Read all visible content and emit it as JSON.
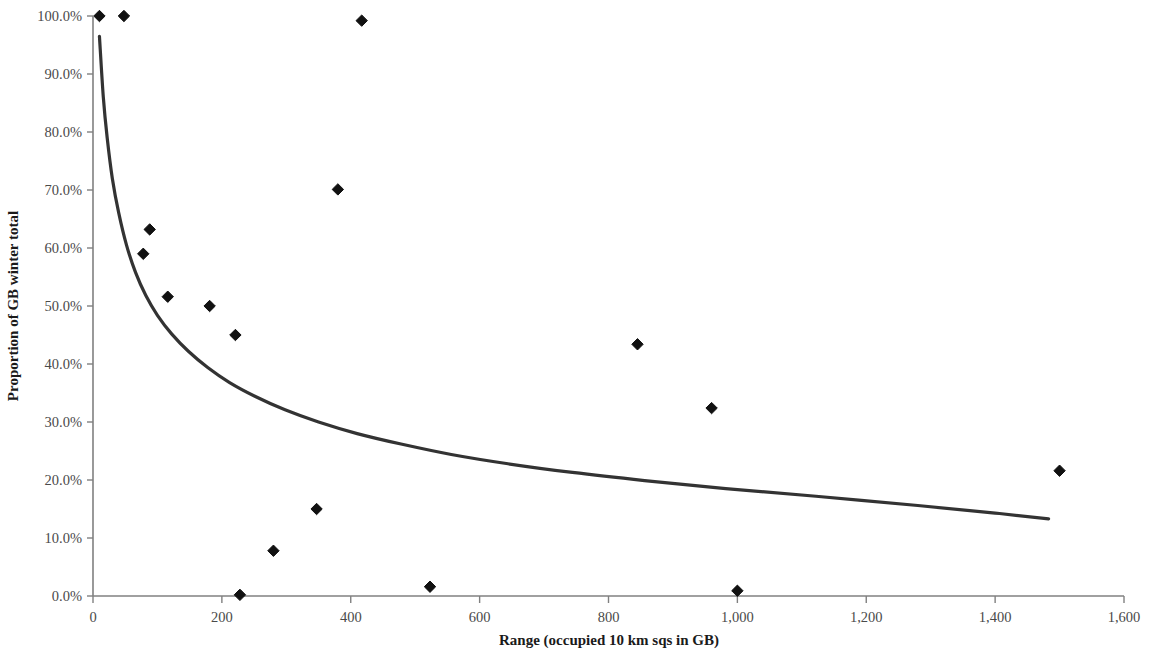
{
  "chart_data": {
    "type": "scatter",
    "title": "",
    "xlabel": "Range (occupied 10 km sqs in GB)",
    "ylabel": "Proportion of GB winter total",
    "xlim": [
      0,
      1600
    ],
    "ylim": [
      0,
      100
    ],
    "grid": false,
    "legend": null,
    "x_ticks": [
      0,
      200,
      400,
      600,
      800,
      1000,
      1200,
      1400,
      1600
    ],
    "x_tick_labels": [
      "0",
      "200",
      "400",
      "600",
      "800",
      "1,000",
      "1,200",
      "1,400",
      "1,600"
    ],
    "y_ticks": [
      0,
      10,
      20,
      30,
      40,
      50,
      60,
      70,
      80,
      90,
      100
    ],
    "y_tick_labels": [
      "0.0%",
      "10.0%",
      "20.0%",
      "30.0%",
      "40.0%",
      "50.0%",
      "60.0%",
      "70.0%",
      "80.0%",
      "90.0%",
      "100.0%"
    ],
    "marker": "diamond",
    "marker_color": "#111111",
    "marker_size": 9,
    "series": [
      {
        "name": "Species",
        "points": [
          {
            "x": 10,
            "y": 100.0
          },
          {
            "x": 48,
            "y": 100.0
          },
          {
            "x": 78,
            "y": 59.0
          },
          {
            "x": 88,
            "y": 63.2
          },
          {
            "x": 116,
            "y": 51.6
          },
          {
            "x": 181,
            "y": 50.0
          },
          {
            "x": 221,
            "y": 45.0
          },
          {
            "x": 228,
            "y": 0.2
          },
          {
            "x": 280,
            "y": 7.8
          },
          {
            "x": 347,
            "y": 15.0
          },
          {
            "x": 380,
            "y": 70.1
          },
          {
            "x": 417,
            "y": 99.2
          },
          {
            "x": 523,
            "y": 1.6
          },
          {
            "x": 845,
            "y": 43.4
          },
          {
            "x": 960,
            "y": 32.4
          },
          {
            "x": 1000,
            "y": 0.9
          },
          {
            "x": 1500,
            "y": 21.6
          }
        ]
      }
    ],
    "trendline": {
      "type": "power",
      "color": "#333333",
      "width": 3.2,
      "x_start": 10,
      "x_end": 1483,
      "y_start": 96.5,
      "y_end": 13.3,
      "points": [
        {
          "x": 10,
          "y": 96.5
        },
        {
          "x": 16,
          "y": 86.0
        },
        {
          "x": 22,
          "y": 79.0
        },
        {
          "x": 30,
          "y": 72.0
        },
        {
          "x": 40,
          "y": 66.0
        },
        {
          "x": 52,
          "y": 60.5
        },
        {
          "x": 66,
          "y": 55.8
        },
        {
          "x": 82,
          "y": 51.8
        },
        {
          "x": 100,
          "y": 48.4
        },
        {
          "x": 122,
          "y": 45.2
        },
        {
          "x": 148,
          "y": 42.2
        },
        {
          "x": 178,
          "y": 39.4
        },
        {
          "x": 212,
          "y": 36.8
        },
        {
          "x": 252,
          "y": 34.4
        },
        {
          "x": 298,
          "y": 32.1
        },
        {
          "x": 350,
          "y": 30.0
        },
        {
          "x": 410,
          "y": 28.0
        },
        {
          "x": 478,
          "y": 26.2
        },
        {
          "x": 556,
          "y": 24.4
        },
        {
          "x": 644,
          "y": 22.8
        },
        {
          "x": 744,
          "y": 21.3
        },
        {
          "x": 856,
          "y": 19.9
        },
        {
          "x": 982,
          "y": 18.5
        },
        {
          "x": 1122,
          "y": 17.2
        },
        {
          "x": 1280,
          "y": 15.6
        },
        {
          "x": 1400,
          "y": 14.3
        },
        {
          "x": 1483,
          "y": 13.3
        }
      ]
    },
    "axis_color": "#808080",
    "plot_area": {
      "left": 93,
      "right": 1124,
      "top": 16,
      "bottom": 596
    }
  }
}
